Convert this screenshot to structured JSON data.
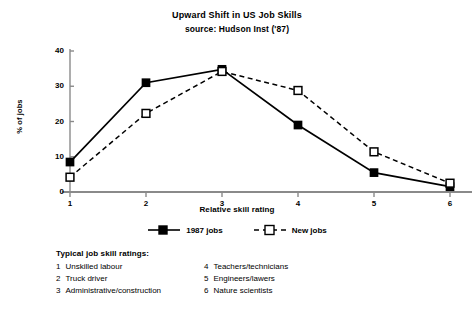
{
  "chart_data": {
    "type": "line",
    "title": "Upward Shift in US Job Skills",
    "subtitle": "source: Hudson Inst ('87)",
    "xlabel": "Relative skill rating",
    "ylabel": "% of jobs",
    "x": [
      1,
      2,
      3,
      4,
      5,
      6
    ],
    "categories": [
      "1",
      "2",
      "3",
      "4",
      "5",
      "6"
    ],
    "xlim": [
      1,
      6
    ],
    "ylim": [
      0,
      40
    ],
    "yticks": [
      0,
      10,
      20,
      30,
      40
    ],
    "ytick_labels": [
      "0",
      "10",
      "20",
      "30",
      "40"
    ],
    "xticks": [
      1,
      2,
      3,
      4,
      5,
      6
    ],
    "xtick_labels": [
      "1",
      "2",
      "3",
      "4",
      "5",
      "6"
    ],
    "grid": false,
    "legend_position": "below-axis-center",
    "series": [
      {
        "name": "1987 jobs",
        "values": [
          8.5,
          31,
          34.8,
          19,
          5.5,
          1.5
        ],
        "line_style": "solid",
        "marker": "filled-square",
        "color": "#000000"
      },
      {
        "name": "New jobs",
        "values": [
          4.2,
          22.3,
          34.2,
          28.8,
          11.4,
          2.5
        ],
        "line_style": "dashed",
        "marker": "open-square",
        "color": "#000000"
      }
    ]
  },
  "notes": {
    "heading": "Typical job skill ratings:",
    "left_column": [
      {
        "num": "1",
        "label": "Unskilled labour"
      },
      {
        "num": "2",
        "label": "Truck driver"
      },
      {
        "num": "3",
        "label": "Administrative/construction"
      }
    ],
    "right_column": [
      {
        "num": "4",
        "label": "Teachers/technicians"
      },
      {
        "num": "5",
        "label": "Engineers/lawers"
      },
      {
        "num": "6",
        "label": "Nature scientists"
      }
    ]
  },
  "colors": {
    "axis": "#8a8a8a",
    "series": "#000000",
    "background": "#ffffff"
  }
}
